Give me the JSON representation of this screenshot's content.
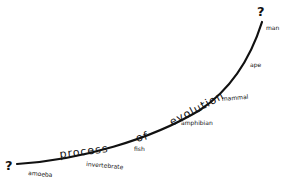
{
  "diagram": {
    "title_words": [
      "process",
      "of",
      "evolution"
    ],
    "start_marker": "?",
    "end_marker": "?",
    "stages": [
      {
        "label": "amoeba"
      },
      {
        "label": "invertebrate"
      },
      {
        "label": "fish"
      },
      {
        "label": "amphibian"
      },
      {
        "label": "mammal"
      },
      {
        "label": "ape"
      },
      {
        "label": "man"
      }
    ],
    "colors": {
      "ink": "#111111",
      "background": "#ffffff"
    }
  }
}
